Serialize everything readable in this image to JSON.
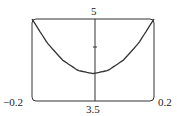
{
  "chart_data": {
    "type": "line",
    "title": "",
    "xlabel": "",
    "ylabel": "",
    "xlim": [
      -0.2,
      0.2
    ],
    "ylim": [
      3.5,
      5
    ],
    "grid": false,
    "legend": null,
    "tick_labels": {
      "x_left": "−0.2",
      "x_right": "0.2",
      "y_bottom": "3.5",
      "y_top": "5"
    },
    "y_ticks": [
      4.5
    ],
    "series": [
      {
        "name": "curve",
        "x": [
          -0.2,
          -0.15,
          -0.1,
          -0.05,
          0,
          0.05,
          0.1,
          0.15,
          0.2
        ],
        "y": [
          5.0,
          4.56,
          4.25,
          4.06,
          4.0,
          4.06,
          4.25,
          4.56,
          5.0
        ]
      }
    ],
    "colors": {
      "curve": "#333333",
      "frame": "#333333"
    }
  }
}
